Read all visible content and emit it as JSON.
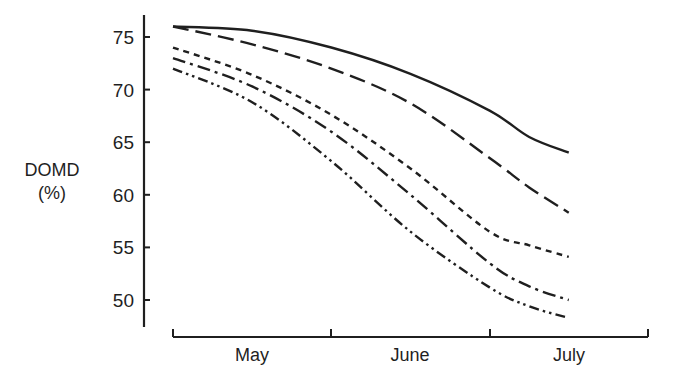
{
  "chart_data": {
    "type": "line",
    "title": "",
    "xlabel": "",
    "ylabel": "DOMD (%)",
    "ylabel_lines": [
      "DOMD",
      "(%)"
    ],
    "ylim": [
      47.5,
      77
    ],
    "yticks": [
      50,
      55,
      60,
      65,
      70,
      75
    ],
    "x_categories": [
      "May",
      "June",
      "July"
    ],
    "x_positions": [
      0,
      0.25,
      0.5,
      0.75,
      1.0,
      1.25,
      1.5,
      1.75,
      2.5
    ],
    "x_note": "x in months from start of May (0=start May, 1=start June, 2=start July); curves end around mid-July",
    "grid": false,
    "legend": "none",
    "series": [
      {
        "name": "series-1-solid",
        "style": "solid",
        "x": [
          0,
          0.5,
          1.0,
          1.5,
          2.0,
          2.25,
          2.5
        ],
        "values": [
          76.0,
          75.6,
          74.0,
          71.5,
          68.0,
          65.5,
          64.0
        ]
      },
      {
        "name": "series-2-long-dash",
        "style": "long-dash",
        "x": [
          0,
          0.5,
          1.0,
          1.5,
          2.0,
          2.25,
          2.5
        ],
        "values": [
          76.0,
          74.3,
          72.0,
          68.7,
          63.5,
          60.7,
          58.3
        ]
      },
      {
        "name": "series-3-short-dash",
        "style": "short-dash",
        "x": [
          0,
          0.5,
          1.0,
          1.5,
          2.0,
          2.25,
          2.5
        ],
        "values": [
          74.0,
          71.4,
          67.6,
          62.5,
          56.5,
          55.2,
          54.1
        ]
      },
      {
        "name": "series-4-dash-dot",
        "style": "dash-dot",
        "x": [
          0,
          0.5,
          1.0,
          1.5,
          2.0,
          2.25,
          2.5
        ],
        "values": [
          73.0,
          70.3,
          66.0,
          60.0,
          53.5,
          51.3,
          50.0
        ]
      },
      {
        "name": "series-5-dash-dot-dot",
        "style": "dash-dot-dot",
        "x": [
          0,
          0.5,
          1.0,
          1.5,
          2.0,
          2.25,
          2.5
        ],
        "values": [
          72.0,
          68.8,
          63.2,
          56.5,
          51.2,
          49.4,
          48.3
        ]
      }
    ]
  },
  "colors": {
    "ink": "#1f1f1f",
    "background": "#ffffff"
  }
}
